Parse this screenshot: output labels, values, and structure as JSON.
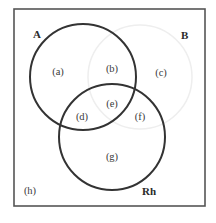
{
  "diagram": {
    "type": "venn",
    "sets": [
      {
        "id": "A",
        "label": "A",
        "stroke": "#333333"
      },
      {
        "id": "B",
        "label": "B",
        "stroke": "#eeeeee"
      },
      {
        "id": "Rh",
        "label": "Rh",
        "stroke": "#333333"
      }
    ],
    "regions": [
      {
        "id": "a",
        "label": "(a)",
        "sets": [
          "A"
        ]
      },
      {
        "id": "b",
        "label": "(b)",
        "sets": [
          "A",
          "B"
        ]
      },
      {
        "id": "c",
        "label": "(c)",
        "sets": [
          "B"
        ]
      },
      {
        "id": "d",
        "label": "(d)",
        "sets": [
          "A",
          "Rh"
        ]
      },
      {
        "id": "e",
        "label": "(e)",
        "sets": [
          "A",
          "B",
          "Rh"
        ]
      },
      {
        "id": "f",
        "label": "(f)",
        "sets": [
          "B",
          "Rh"
        ]
      },
      {
        "id": "g",
        "label": "(g)",
        "sets": [
          "Rh"
        ]
      },
      {
        "id": "h",
        "label": "(h)",
        "sets": []
      }
    ],
    "frame_color": "#555555",
    "background": "#ffffff"
  }
}
